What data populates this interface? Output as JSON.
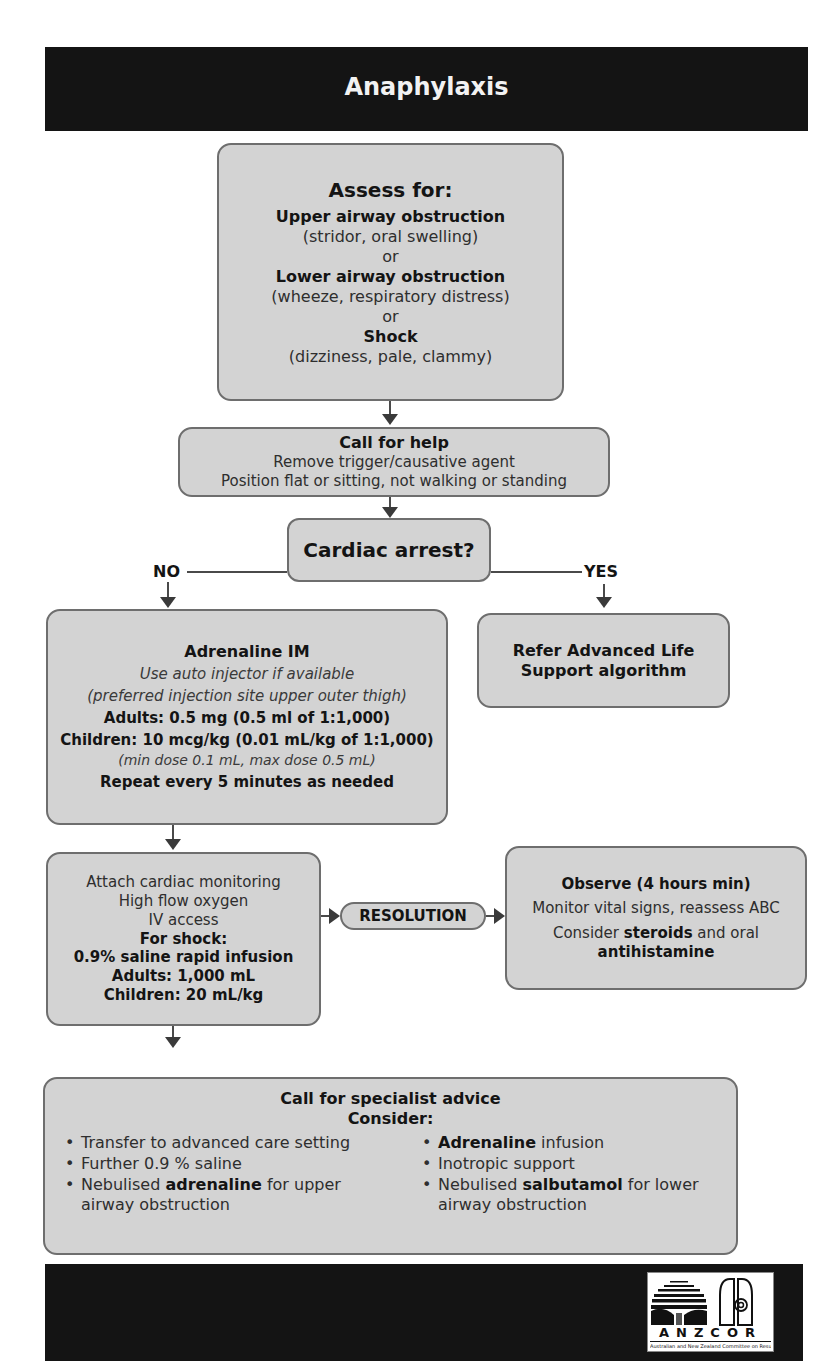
{
  "header": {
    "title": "Anaphylaxis"
  },
  "assess": {
    "title": "Assess for:",
    "items": [
      {
        "heading": "Upper airway obstruction",
        "detail": "(stridor, oral swelling)"
      },
      {
        "heading": "Lower airway obstruction",
        "detail": "(wheeze, respiratory distress)"
      },
      {
        "heading": "Shock",
        "detail": "(dizziness, pale, clammy)"
      }
    ],
    "separator": "or"
  },
  "call_help": {
    "title": "Call for help",
    "lines": [
      "Remove trigger/causative agent",
      "Position flat or sitting, not walking or standing"
    ]
  },
  "decision": {
    "question": "Cardiac arrest?",
    "no_label": "NO",
    "yes_label": "YES"
  },
  "adrenaline": {
    "title": "Adrenaline IM",
    "note1": "Use auto injector if available",
    "note2": "(preferred injection site upper outer thigh)",
    "adults": "Adults: 0.5 mg (0.5 ml of 1:1,000)",
    "children": "Children: 10 mcg/kg (0.01 mL/kg of 1:1,000)",
    "dose_range": "(min dose 0.1 mL, max dose 0.5 mL)",
    "repeat": "Repeat every 5 minutes as needed"
  },
  "als": {
    "text_line1": "Refer Advanced Life",
    "text_line2": "Support algorithm"
  },
  "monitoring": {
    "lines": [
      "Attach cardiac monitoring",
      "High flow oxygen",
      "IV access"
    ],
    "shock_title": "For shock:",
    "shock_lines": [
      "0.9% saline rapid infusion",
      "Adults: 1,000 mL",
      "Children: 20 mL/kg"
    ]
  },
  "resolution": {
    "label": "RESOLUTION"
  },
  "observe": {
    "title": "Observe (4 hours min)",
    "line1": "Monitor vital signs, reassess ABC",
    "consider_prefix": "Consider ",
    "steroids": "steroids",
    "and_oral": " and oral",
    "antihistamine": "antihistamine"
  },
  "specialist": {
    "title": "Call for specialist advice",
    "subtitle": "Consider:",
    "left_items": [
      {
        "pre": "Transfer to advanced care setting",
        "bold": "",
        "post": ""
      },
      {
        "pre": "Further 0.9 % saline",
        "bold": "",
        "post": ""
      },
      {
        "pre": "Nebulised ",
        "bold": "adrenaline",
        "post": " for upper airway obstruction"
      }
    ],
    "right_items": [
      {
        "pre": "",
        "bold": "Adrenaline",
        "post": " infusion"
      },
      {
        "pre": "Inotropic support",
        "bold": "",
        "post": ""
      },
      {
        "pre": "Nebulised ",
        "bold": "salbutamol",
        "post": " for lower airway obstruction"
      }
    ]
  },
  "footer": {
    "logo_name": "ANZCOR",
    "logo_subtitle": "Australian and New Zealand Committee on Resuscitation"
  },
  "colors": {
    "banner": "#141414",
    "box_fill": "#d3d3d3",
    "box_border": "#6e6e6e",
    "text": "#1e1e1e"
  }
}
